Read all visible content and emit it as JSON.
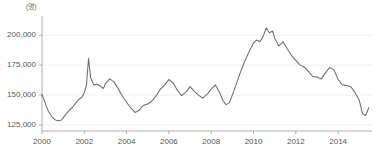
{
  "chart_data": {
    "type": "line",
    "title": "",
    "subtitle": "",
    "xlabel": "",
    "ylabel": "",
    "unit_label": "(명)",
    "xlim": [
      2000.0,
      2015.6
    ],
    "ylim": [
      120000,
      211000
    ],
    "grid": true,
    "legend": "none",
    "ytick_labels": [
      "200,000",
      "175,000",
      "150,000",
      "125,000"
    ],
    "ytick_values": [
      200000,
      175000,
      150000,
      125000
    ],
    "xtick_labels": [
      "2000",
      "2002",
      "2004",
      "2006",
      "2008",
      "2010",
      "2012",
      "2014"
    ],
    "xtick_values": [
      2000,
      2002,
      2004,
      2006,
      2008,
      2010,
      2012,
      2014
    ],
    "series": [
      {
        "name": "series-1",
        "color": "#6b6b6b",
        "x": [
          2000.0,
          2000.1,
          2000.2,
          2000.3,
          2000.45,
          2000.6,
          2000.75,
          2000.9,
          2001.0,
          2001.15,
          2001.3,
          2001.45,
          2001.6,
          2001.75,
          2001.9,
          2002.0,
          2002.1,
          2002.2,
          2002.3,
          2002.45,
          2002.6,
          2002.75,
          2002.9,
          2003.0,
          2003.2,
          2003.4,
          2003.6,
          2003.8,
          2004.0,
          2004.2,
          2004.4,
          2004.6,
          2004.8,
          2005.0,
          2005.2,
          2005.4,
          2005.6,
          2005.8,
          2006.0,
          2006.2,
          2006.4,
          2006.6,
          2006.8,
          2007.0,
          2007.2,
          2007.4,
          2007.6,
          2007.8,
          2008.0,
          2008.2,
          2008.4,
          2008.55,
          2008.7,
          2008.85,
          2009.0,
          2009.2,
          2009.4,
          2009.6,
          2009.8,
          2010.0,
          2010.15,
          2010.3,
          2010.45,
          2010.6,
          2010.75,
          2010.9,
          2011.0,
          2011.2,
          2011.4,
          2011.6,
          2011.8,
          2012.0,
          2012.2,
          2012.4,
          2012.6,
          2012.8,
          2013.0,
          2013.2,
          2013.4,
          2013.6,
          2013.8,
          2014.0,
          2014.2,
          2014.4,
          2014.6,
          2014.8,
          2015.0,
          2015.15,
          2015.3,
          2015.45
        ],
        "y": [
          150500,
          146000,
          141000,
          136500,
          132500,
          129500,
          128500,
          129000,
          131000,
          134500,
          137500,
          140000,
          143500,
          146500,
          148500,
          152000,
          158000,
          180500,
          164500,
          158500,
          159000,
          157500,
          155500,
          159500,
          163500,
          161000,
          155500,
          149000,
          144000,
          139000,
          135500,
          137500,
          141500,
          142500,
          145000,
          149500,
          155000,
          158500,
          163000,
          160000,
          154000,
          149500,
          152500,
          157000,
          153000,
          150000,
          147500,
          150500,
          155000,
          158500,
          152000,
          145500,
          142000,
          143500,
          150000,
          160000,
          170000,
          179000,
          186500,
          193500,
          196000,
          194500,
          199000,
          206000,
          202000,
          203500,
          197500,
          191000,
          194500,
          188500,
          183000,
          179000,
          175000,
          173500,
          169500,
          165500,
          165000,
          163500,
          168500,
          173000,
          171000,
          163000,
          158500,
          158000,
          157000,
          152000,
          145500,
          134500,
          133000,
          139500
        ]
      }
    ],
    "annotations": [],
    "notes": {
      "peak_value": 206000,
      "peak_x": 2010.6,
      "spike_value": 180500,
      "spike_x": 2002.2,
      "min_value": 128500,
      "min_x": 2000.75,
      "last_value": 139500,
      "last_x": 2015.45
    }
  }
}
